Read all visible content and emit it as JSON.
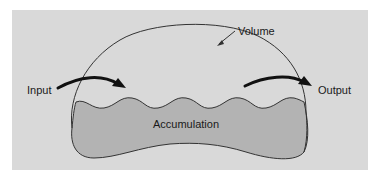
{
  "diagram": {
    "labels": {
      "volume": "Volume",
      "input": "Input",
      "output": "Output",
      "accumulation": "Accumulation"
    },
    "colors": {
      "background": "#d9d9d9",
      "accumulation_fill": "#b3b3b3",
      "outline": "#333333",
      "arrow": "#111111"
    }
  }
}
